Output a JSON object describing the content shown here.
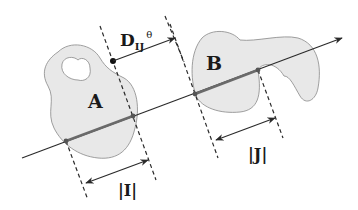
{
  "diagram": {
    "colors": {
      "background": "#ffffff",
      "region_fill": "#e8e8e8",
      "region_stroke": "#888888",
      "line": "#2a2a2a",
      "segment": "#6a6a6a",
      "dashed": "#2a2a2a",
      "point": "#555555"
    },
    "labels": {
      "region_a": "A",
      "region_b": "B",
      "distance_main": "D",
      "distance_sub": "IJ",
      "distance_sup": "θ",
      "interval_i": "|I|",
      "interval_j": "|J|"
    }
  }
}
